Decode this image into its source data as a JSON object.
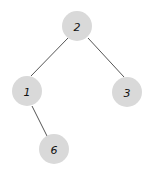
{
  "tree": {
    "nodes": [
      {
        "id": "n2",
        "label": "2",
        "x": 77,
        "y": 26
      },
      {
        "id": "n1",
        "label": "1",
        "x": 27,
        "y": 91
      },
      {
        "id": "n3",
        "label": "3",
        "x": 127,
        "y": 92
      },
      {
        "id": "n6",
        "label": "6",
        "x": 54,
        "y": 149
      }
    ],
    "edges": [
      {
        "from": "2",
        "to": "1"
      },
      {
        "from": "2",
        "to": "3"
      },
      {
        "from": "1",
        "to": "6"
      }
    ],
    "node_fill": "#d9d9d9",
    "edge_color": "#555555"
  }
}
